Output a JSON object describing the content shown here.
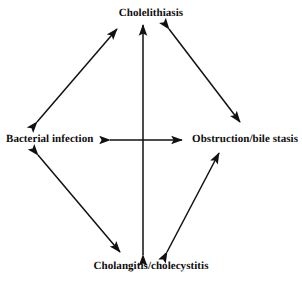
{
  "figure": {
    "type": "cycle-diagram",
    "shape": "diamond",
    "background_color": "#ffffff",
    "stroke_color": "#111111",
    "text_color": "#0d0d0d"
  },
  "nodes": [
    {
      "id": "top",
      "label": "Cholelithiasis"
    },
    {
      "id": "left",
      "label": "Bacterial infection"
    },
    {
      "id": "right",
      "label": "Obstruction/bile stasis"
    },
    {
      "id": "bottom",
      "label": "Cholangitis/cholecystitis"
    }
  ],
  "edges": [
    {
      "id": "top-left-edge",
      "from": "Bacterial infection",
      "to": "Cholelithiasis",
      "arrows": "both"
    },
    {
      "id": "top-right-edge",
      "from": "Cholelithiasis",
      "to": "Obstruction/bile stasis",
      "arrows": "both"
    },
    {
      "id": "bottom-left-edge",
      "from": "Bacterial infection",
      "to": "Cholangitis/cholecystitis",
      "arrows": "both"
    },
    {
      "id": "bottom-right-edge",
      "from": "Cholangitis/cholecystitis",
      "to": "Obstruction/bile stasis",
      "arrows": "both"
    },
    {
      "id": "vertical-edge",
      "from": "Cholangitis/cholecystitis",
      "to": "Cholelithiasis",
      "arrows": "both"
    },
    {
      "id": "horizontal-edge",
      "from": "Bacterial infection",
      "to": "Obstruction/bile stasis",
      "arrows": "both"
    }
  ]
}
